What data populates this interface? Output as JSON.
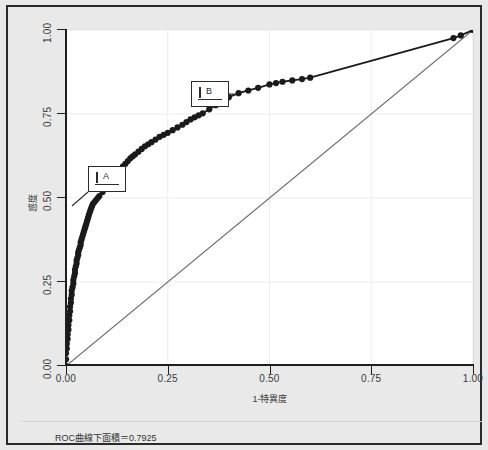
{
  "caption": "ROC曲線下面積＝0.7925",
  "annotations": [
    {
      "name": "A",
      "label": "A",
      "box_x": 86,
      "box_y": 164,
      "leader_to_x": 70,
      "leader_to_y": 204
    },
    {
      "name": "B",
      "label": "B",
      "box_x": 189,
      "box_y": 79,
      "leader_to_x": 232,
      "leader_to_y": 92
    }
  ],
  "chart_data": {
    "type": "line",
    "title": "",
    "subtitle": "",
    "xlabel": "1-特異度",
    "ylabel": "感度",
    "xlim": [
      0.0,
      1.0
    ],
    "ylim": [
      0.0,
      1.0
    ],
    "xticks": [
      0.0,
      0.25,
      0.5,
      0.75,
      1.0
    ],
    "yticks": [
      0.0,
      0.25,
      0.5,
      0.75,
      1.0
    ],
    "xtick_labels": [
      "0.00",
      "0.25",
      "0.50",
      "0.75",
      "1.00"
    ],
    "ytick_labels": [
      "0.00",
      "0.25",
      "0.50",
      "0.75",
      "1.00"
    ],
    "grid": true,
    "legend": false,
    "auc": 0.7925,
    "marker": "filled-circle",
    "marker_color": "#1a1a1a",
    "line_color": "#1a1a1a",
    "reference_line_color": "#6e6e6e",
    "reference_line": {
      "from": [
        0.0,
        0.0
      ],
      "to": [
        1.0,
        1.0
      ]
    },
    "series": [
      {
        "name": "ROC",
        "points": [
          [
            0.0,
            0.0
          ],
          [
            0.0,
            0.02
          ],
          [
            0.0,
            0.038
          ],
          [
            0.002,
            0.052
          ],
          [
            0.002,
            0.066
          ],
          [
            0.004,
            0.08
          ],
          [
            0.004,
            0.094
          ],
          [
            0.006,
            0.108
          ],
          [
            0.006,
            0.122
          ],
          [
            0.008,
            0.136
          ],
          [
            0.008,
            0.15
          ],
          [
            0.01,
            0.163
          ],
          [
            0.01,
            0.176
          ],
          [
            0.012,
            0.188
          ],
          [
            0.012,
            0.2
          ],
          [
            0.014,
            0.212
          ],
          [
            0.014,
            0.224
          ],
          [
            0.016,
            0.234
          ],
          [
            0.018,
            0.245
          ],
          [
            0.018,
            0.256
          ],
          [
            0.02,
            0.266
          ],
          [
            0.022,
            0.276
          ],
          [
            0.022,
            0.286
          ],
          [
            0.024,
            0.296
          ],
          [
            0.026,
            0.305
          ],
          [
            0.026,
            0.314
          ],
          [
            0.028,
            0.322
          ],
          [
            0.03,
            0.33
          ],
          [
            0.03,
            0.338
          ],
          [
            0.032,
            0.346
          ],
          [
            0.034,
            0.353
          ],
          [
            0.036,
            0.36
          ],
          [
            0.036,
            0.368
          ],
          [
            0.038,
            0.376
          ],
          [
            0.04,
            0.384
          ],
          [
            0.042,
            0.392
          ],
          [
            0.044,
            0.4
          ],
          [
            0.046,
            0.408
          ],
          [
            0.048,
            0.416
          ],
          [
            0.05,
            0.424
          ],
          [
            0.052,
            0.432
          ],
          [
            0.054,
            0.44
          ],
          [
            0.056,
            0.448
          ],
          [
            0.058,
            0.456
          ],
          [
            0.06,
            0.463
          ],
          [
            0.062,
            0.47
          ],
          [
            0.064,
            0.476
          ],
          [
            0.066,
            0.482
          ],
          [
            0.07,
            0.488
          ],
          [
            0.074,
            0.494
          ],
          [
            0.078,
            0.5
          ],
          [
            0.082,
            0.506
          ],
          [
            0.09,
            0.518
          ],
          [
            0.098,
            0.53
          ],
          [
            0.106,
            0.542
          ],
          [
            0.114,
            0.554
          ],
          [
            0.122,
            0.566
          ],
          [
            0.128,
            0.576
          ],
          [
            0.134,
            0.586
          ],
          [
            0.14,
            0.594
          ],
          [
            0.146,
            0.602
          ],
          [
            0.152,
            0.61
          ],
          [
            0.158,
            0.618
          ],
          [
            0.164,
            0.624
          ],
          [
            0.17,
            0.63
          ],
          [
            0.178,
            0.638
          ],
          [
            0.186,
            0.646
          ],
          [
            0.194,
            0.654
          ],
          [
            0.202,
            0.66
          ],
          [
            0.21,
            0.666
          ],
          [
            0.22,
            0.674
          ],
          [
            0.23,
            0.682
          ],
          [
            0.24,
            0.688
          ],
          [
            0.25,
            0.694
          ],
          [
            0.262,
            0.702
          ],
          [
            0.274,
            0.71
          ],
          [
            0.286,
            0.718
          ],
          [
            0.296,
            0.726
          ],
          [
            0.306,
            0.734
          ],
          [
            0.316,
            0.74
          ],
          [
            0.326,
            0.746
          ],
          [
            0.336,
            0.752
          ],
          [
            0.352,
            0.764
          ],
          [
            0.368,
            0.776
          ],
          [
            0.384,
            0.788
          ],
          [
            0.4,
            0.8
          ],
          [
            0.424,
            0.812
          ],
          [
            0.448,
            0.82
          ],
          [
            0.472,
            0.828
          ],
          [
            0.5,
            0.838
          ],
          [
            0.516,
            0.842
          ],
          [
            0.532,
            0.846
          ],
          [
            0.556,
            0.85
          ],
          [
            0.58,
            0.854
          ],
          [
            0.6,
            0.858
          ],
          [
            0.952,
            0.976
          ],
          [
            0.97,
            0.984
          ],
          [
            1.0,
            1.0
          ]
        ]
      }
    ]
  }
}
